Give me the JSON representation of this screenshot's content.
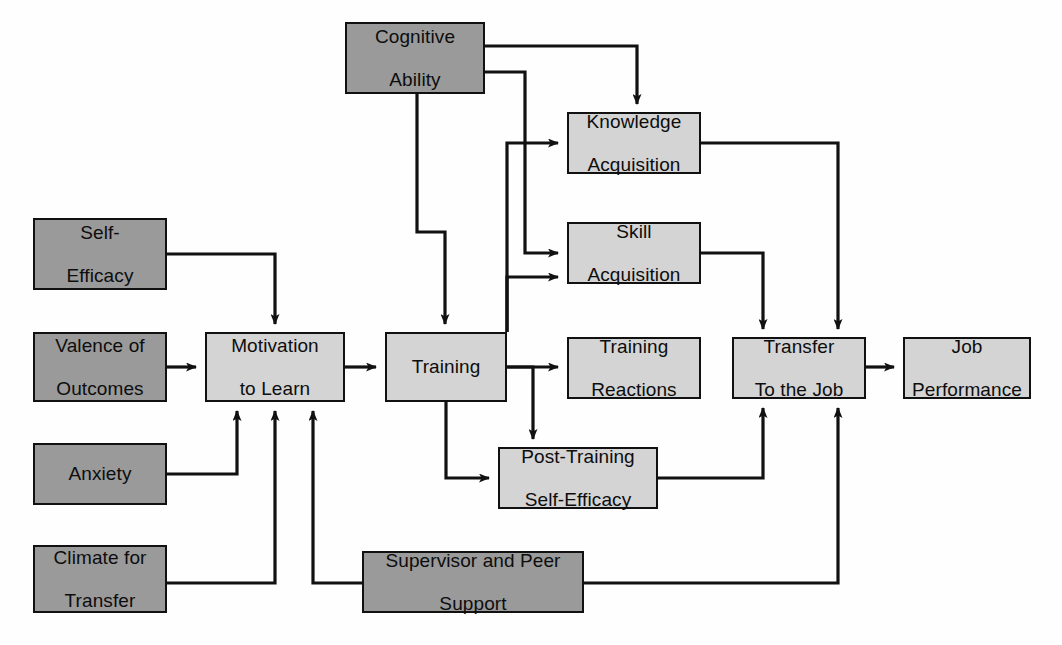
{
  "diagram": {
    "colors": {
      "antecedent_fill": "#9a9a9a",
      "process_fill": "#d4d4d4",
      "border": "#111111",
      "background": "#ffffff",
      "edge": "#111111"
    },
    "node_kinds": {
      "dark": "antecedent / individual-and-situational input variable",
      "light": "training process or outcome variable"
    },
    "nodes": [
      {
        "id": "cognitive-ability",
        "label": "Cognitive\nAbility",
        "line1": "Cognitive",
        "line2": "Ability",
        "kind": "dark",
        "x": 345,
        "y": 22,
        "w": 140,
        "h": 72
      },
      {
        "id": "knowledge-acquisition",
        "label": "Knowledge\nAcquisition",
        "line1": "Knowledge",
        "line2": "Acquisition",
        "kind": "light",
        "x": 567,
        "y": 112,
        "w": 134,
        "h": 62
      },
      {
        "id": "skill-acquisition",
        "label": "Skill\nAcquisition",
        "line1": "Skill",
        "line2": "Acquisition",
        "kind": "light",
        "x": 567,
        "y": 222,
        "w": 134,
        "h": 62
      },
      {
        "id": "self-efficacy",
        "label": "Self-\nEfficacy",
        "line1": "Self-",
        "line2": "Efficacy",
        "kind": "dark",
        "x": 33,
        "y": 218,
        "w": 134,
        "h": 72
      },
      {
        "id": "valence-of-outcomes",
        "label": "Valence of\nOutcomes",
        "line1": "Valence of",
        "line2": "Outcomes",
        "kind": "dark",
        "x": 33,
        "y": 332,
        "w": 134,
        "h": 70
      },
      {
        "id": "motivation-to-learn",
        "label": "Motivation\nto Learn",
        "line1": "Motivation",
        "line2": "to Learn",
        "kind": "light",
        "x": 205,
        "y": 332,
        "w": 140,
        "h": 70
      },
      {
        "id": "training",
        "label": "Training",
        "line1": "Training",
        "line2": "",
        "kind": "light",
        "x": 385,
        "y": 332,
        "w": 122,
        "h": 70
      },
      {
        "id": "training-reactions",
        "label": "Training\nReactions",
        "line1": "Training",
        "line2": "Reactions",
        "kind": "light",
        "x": 567,
        "y": 337,
        "w": 134,
        "h": 62
      },
      {
        "id": "transfer-to-the-job",
        "label": "Transfer\nTo the Job",
        "line1": "Transfer",
        "line2": "To the Job",
        "kind": "light",
        "x": 732,
        "y": 337,
        "w": 134,
        "h": 62
      },
      {
        "id": "job-performance",
        "label": "Job\nPerformance",
        "line1": "Job",
        "line2": "Performance",
        "kind": "light",
        "x": 903,
        "y": 337,
        "w": 128,
        "h": 62
      },
      {
        "id": "anxiety",
        "label": "Anxiety",
        "line1": "Anxiety",
        "line2": "",
        "kind": "dark",
        "x": 33,
        "y": 443,
        "w": 134,
        "h": 62
      },
      {
        "id": "post-training-self-efficacy",
        "label": "Post-Training\nSelf-Efficacy",
        "line1": "Post-Training",
        "line2": "Self-Efficacy",
        "kind": "light",
        "x": 498,
        "y": 447,
        "w": 160,
        "h": 62
      },
      {
        "id": "climate-for-transfer",
        "label": "Climate for\nTransfer",
        "line1": "Climate for",
        "line2": "Transfer",
        "kind": "dark",
        "x": 33,
        "y": 545,
        "w": 134,
        "h": 68
      },
      {
        "id": "supervisor-and-peer-support",
        "label": "Supervisor and Peer\nSupport",
        "line1": "Supervisor and Peer",
        "line2": "Support",
        "kind": "dark",
        "x": 362,
        "y": 551,
        "w": 222,
        "h": 62
      }
    ],
    "edges": [
      {
        "id": "cognitive-ability-to-knowledge-acquisition",
        "from": "cognitive-ability",
        "to": "knowledge-acquisition"
      },
      {
        "id": "cognitive-ability-to-skill-acquisition",
        "from": "cognitive-ability",
        "to": "skill-acquisition"
      },
      {
        "id": "cognitive-ability-to-training",
        "from": "cognitive-ability",
        "to": "training"
      },
      {
        "id": "self-efficacy-to-motivation-to-learn",
        "from": "self-efficacy",
        "to": "motivation-to-learn"
      },
      {
        "id": "valence-of-outcomes-to-motivation-to-learn",
        "from": "valence-of-outcomes",
        "to": "motivation-to-learn"
      },
      {
        "id": "anxiety-to-motivation-to-learn",
        "from": "anxiety",
        "to": "motivation-to-learn"
      },
      {
        "id": "climate-for-transfer-to-motivation-to-learn",
        "from": "climate-for-transfer",
        "to": "motivation-to-learn"
      },
      {
        "id": "supervisor-support-to-motivation-to-learn",
        "from": "supervisor-and-peer-support",
        "to": "motivation-to-learn"
      },
      {
        "id": "motivation-to-learn-to-training",
        "from": "motivation-to-learn",
        "to": "training"
      },
      {
        "id": "training-to-knowledge-acquisition",
        "from": "training",
        "to": "knowledge-acquisition"
      },
      {
        "id": "training-to-skill-acquisition",
        "from": "training",
        "to": "skill-acquisition"
      },
      {
        "id": "training-to-training-reactions",
        "from": "training",
        "to": "training-reactions"
      },
      {
        "id": "training-to-post-training-self-efficacy",
        "from": "training",
        "to": "post-training-self-efficacy"
      },
      {
        "id": "training-trunk-to-post-training-self-efficacy",
        "from": "training",
        "to": "post-training-self-efficacy"
      },
      {
        "id": "knowledge-acquisition-to-transfer",
        "from": "knowledge-acquisition",
        "to": "transfer-to-the-job"
      },
      {
        "id": "skill-acquisition-to-transfer",
        "from": "skill-acquisition",
        "to": "transfer-to-the-job"
      },
      {
        "id": "post-training-self-efficacy-to-transfer",
        "from": "post-training-self-efficacy",
        "to": "transfer-to-the-job"
      },
      {
        "id": "supervisor-support-to-transfer",
        "from": "supervisor-and-peer-support",
        "to": "transfer-to-the-job"
      },
      {
        "id": "transfer-to-job-performance",
        "from": "transfer-to-the-job",
        "to": "job-performance"
      }
    ]
  }
}
